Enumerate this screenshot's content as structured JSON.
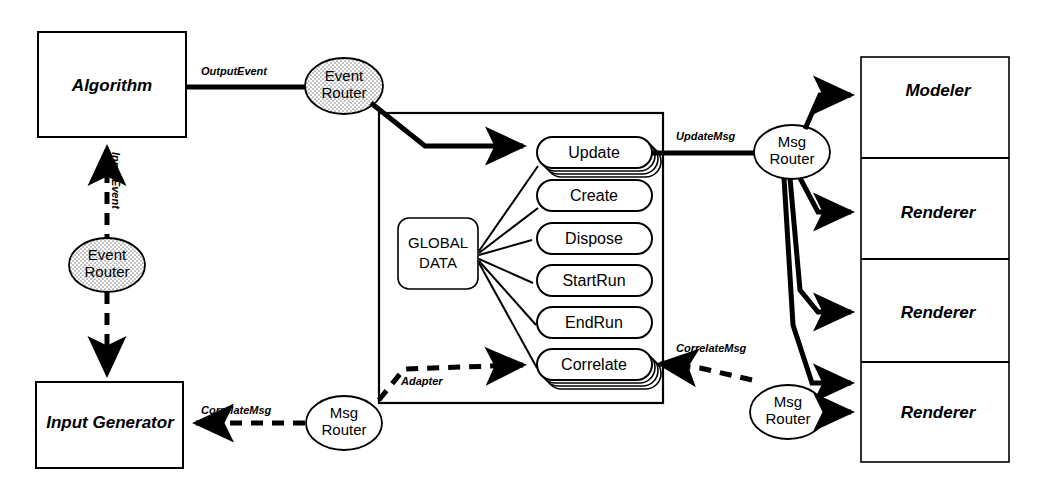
{
  "diagram": {
    "colors": {
      "stroke": "#000000",
      "background": "#ffffff",
      "stipple": "#9a9a9a"
    },
    "nodes": {
      "algorithm": {
        "label": "Algorithm",
        "shape": "rect"
      },
      "input_generator": {
        "label": "Input Generator",
        "shape": "rect"
      },
      "global_data": {
        "label_line1": "GLOBAL",
        "label_line2": "DATA",
        "shape": "rounded-rect"
      }
    },
    "routers": [
      {
        "id": "event-router-top",
        "line1": "Event",
        "line2": "Router",
        "fill": "stipple"
      },
      {
        "id": "event-router-left",
        "line1": "Event",
        "line2": "Router",
        "fill": "stipple"
      },
      {
        "id": "msg-router-bottom-left",
        "line1": "Msg",
        "line2": "Router",
        "fill": "white"
      },
      {
        "id": "msg-router-right-top",
        "line1": "Msg",
        "line2": "Router",
        "fill": "white"
      },
      {
        "id": "msg-router-right-bottom",
        "line1": "Msg",
        "line2": "Router",
        "fill": "white"
      }
    ],
    "operations": [
      {
        "label": "Update",
        "stacked": true
      },
      {
        "label": "Create",
        "stacked": false
      },
      {
        "label": "Dispose",
        "stacked": false
      },
      {
        "label": "StartRun",
        "stacked": false
      },
      {
        "label": "EndRun",
        "stacked": false
      },
      {
        "label": "Correlate",
        "stacked": true
      }
    ],
    "consumers": [
      {
        "label": "Modeler",
        "highlighted": false
      },
      {
        "label": "Renderer",
        "highlighted": false
      },
      {
        "label": "Renderer",
        "highlighted": false
      },
      {
        "label": "Renderer",
        "highlighted": true
      }
    ],
    "edge_labels": [
      {
        "id": "output-event",
        "text": "OutputEvent",
        "style": "solid"
      },
      {
        "id": "input-event",
        "text": "InputEvent",
        "style": "dashed"
      },
      {
        "id": "update-msg",
        "text": "UpdateMsg",
        "style": "solid"
      },
      {
        "id": "correlate-msg-right",
        "text": "CorrelateMsg",
        "style": "dashed"
      },
      {
        "id": "correlate-msg-left",
        "text": "CorrelateMsg",
        "style": "dashed"
      },
      {
        "id": "adapter",
        "text": "Adapter",
        "style": "dashed"
      }
    ]
  }
}
